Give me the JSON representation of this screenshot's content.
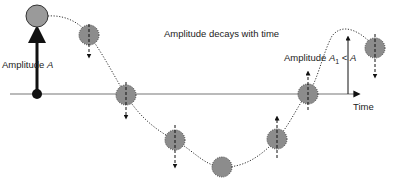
{
  "title": "Amplitude decays with time",
  "labels": {
    "amplitude_a_prefix": "Amplitude ",
    "amplitude_a_var": "A",
    "amplitude_a1_prefix": "Amplitude ",
    "amplitude_a1_var": "A",
    "amplitude_a1_sub": "1",
    "amplitude_a1_rel": " < ",
    "amplitude_a1_rhs": "A",
    "time_axis": "Time"
  },
  "colors": {
    "ball_fill": "#8c8c8c",
    "ball_start_fill": "#9a9a9a",
    "axis": "#777777",
    "arrow": "#111111",
    "path": "#333333"
  },
  "balls": [
    {
      "x": 37,
      "y": 16,
      "r": 11,
      "arrow": "none",
      "style": "solid"
    },
    {
      "x": 89,
      "y": 35,
      "r": 10,
      "arrow": "down",
      "style": "dotted"
    },
    {
      "x": 126,
      "y": 95,
      "r": 10,
      "arrow": "down",
      "style": "dotted"
    },
    {
      "x": 175,
      "y": 140,
      "r": 10,
      "arrow": "down",
      "style": "dotted"
    },
    {
      "x": 222,
      "y": 167,
      "r": 10,
      "arrow": "none",
      "style": "dotted"
    },
    {
      "x": 277,
      "y": 139,
      "r": 10,
      "arrow": "up",
      "style": "dotted"
    },
    {
      "x": 308,
      "y": 94,
      "r": 10,
      "arrow": "up",
      "style": "dotted"
    },
    {
      "x": 375,
      "y": 48,
      "r": 10,
      "arrow": "down",
      "style": "dotted"
    }
  ]
}
